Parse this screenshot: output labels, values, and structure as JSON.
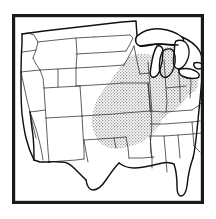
{
  "figure": {
    "kind": "thematic-outline-map",
    "subject": "Contiguous United States",
    "title": "",
    "caption": "",
    "alt_text": "Outline map of the contiguous United States with state boundaries; a stippled region covers the Midwest Corn Belt",
    "background_color": "#ffffff"
  },
  "frame": {
    "name": "map-border",
    "visible": true,
    "color": "#1a1a1a",
    "stroke_width_px": 3.2,
    "x": 12,
    "y": 14,
    "width": 192,
    "height": 190
  },
  "style": {
    "land_fill": "#ffffff",
    "state_boundary_color": "#2b2b2b",
    "state_boundary_width_px": 0.75,
    "national_boundary_color": "#111111",
    "national_boundary_width_px": 1.45,
    "lake_fill": "#ffffff",
    "shade_color": "#c8c8c8",
    "shade_pattern": "stipple-dot-halftone",
    "shade_dot_color": "#8c8c8c"
  },
  "legend": {
    "present": false,
    "entries": []
  },
  "labels": {
    "present": false,
    "items": []
  },
  "shaded_region": {
    "name": "corn-belt-study-area",
    "label": "",
    "pattern": "stipple",
    "fill": "#c8c8c8",
    "approximate_states": [
      "Iowa",
      "Illinois",
      "Indiana",
      "Missouri",
      "Ohio",
      "eastern Kansas",
      "eastern Nebraska",
      "southern Wisconsin",
      "southern Michigan",
      "northern Arkansas",
      "eastern Oklahoma",
      "western Kentucky"
    ]
  },
  "map_regions": [
    {
      "id": "pacific-northwest",
      "states": [
        "Washington",
        "Oregon",
        "Idaho"
      ],
      "shaded": false
    },
    {
      "id": "northern-rockies",
      "states": [
        "Montana",
        "Wyoming"
      ],
      "shaded": false
    },
    {
      "id": "great-basin",
      "states": [
        "Nevada",
        "Utah"
      ],
      "shaded": false
    },
    {
      "id": "southwest",
      "states": [
        "California",
        "Arizona",
        "New Mexico"
      ],
      "shaded": false
    },
    {
      "id": "northern-plains",
      "states": [
        "North Dakota",
        "South Dakota",
        "Minnesota"
      ],
      "shaded": false
    },
    {
      "id": "central-plains",
      "states": [
        "Nebraska",
        "Kansas",
        "Colorado"
      ],
      "shaded": "partial"
    },
    {
      "id": "corn-belt",
      "states": [
        "Iowa",
        "Missouri",
        "Illinois",
        "Indiana",
        "Ohio"
      ],
      "shaded": true
    },
    {
      "id": "great-lakes",
      "states": [
        "Wisconsin",
        "Michigan"
      ],
      "shaded": "partial"
    },
    {
      "id": "south-central",
      "states": [
        "Oklahoma",
        "Texas",
        "Arkansas",
        "Louisiana"
      ],
      "shaded": "partial"
    },
    {
      "id": "southeast",
      "states": [
        "Mississippi",
        "Alabama",
        "Tennessee",
        "Kentucky",
        "Georgia",
        "Florida"
      ],
      "shaded": "partial"
    },
    {
      "id": "appalachia",
      "states": [
        "West Virginia",
        "Virginia",
        "North Carolina",
        "South Carolina"
      ],
      "shaded": false
    }
  ],
  "water_features": [
    {
      "name": "Lake Superior",
      "type": "lake"
    },
    {
      "name": "Lake Michigan",
      "type": "lake"
    },
    {
      "name": "Lake Huron",
      "type": "lake"
    },
    {
      "name": "Lake Erie",
      "type": "lake"
    },
    {
      "name": "Lake Ontario",
      "type": "lake"
    },
    {
      "name": "Gulf of Mexico",
      "type": "sea"
    },
    {
      "name": "Atlantic Ocean",
      "type": "sea"
    },
    {
      "name": "Pacific Ocean",
      "type": "sea"
    }
  ]
}
